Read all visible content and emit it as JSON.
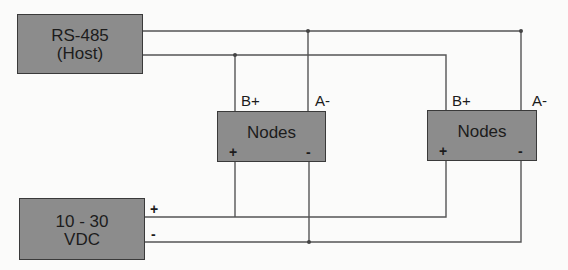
{
  "diagram": {
    "type": "wiring-diagram",
    "host": {
      "line1": "RS-485",
      "line2": "(Host)"
    },
    "power": {
      "line1": "10 - 30",
      "line2": "VDC",
      "plus": "+",
      "minus": "-"
    },
    "nodes": [
      {
        "label": "Nodes",
        "pin_b": "B+",
        "pin_a": "A-",
        "plus": "+",
        "minus": "-"
      },
      {
        "label": "Nodes",
        "pin_b": "B+",
        "pin_a": "A-",
        "plus": "+",
        "minus": "-"
      }
    ],
    "colors": {
      "box_fill": "#8c8c8c",
      "box_border": "#3a3a3a",
      "wire": "#555555",
      "background": "#fbfbfa"
    },
    "connections": [
      {
        "from": "RS-485 (Host)",
        "to": "Nodes A-",
        "wire": "A-"
      },
      {
        "from": "RS-485 (Host)",
        "to": "Nodes B+",
        "wire": "B+"
      },
      {
        "from": "10 - 30 VDC +",
        "to": "Nodes +",
        "wire": "+"
      },
      {
        "from": "10 - 30 VDC -",
        "to": "Nodes -",
        "wire": "-"
      }
    ]
  }
}
